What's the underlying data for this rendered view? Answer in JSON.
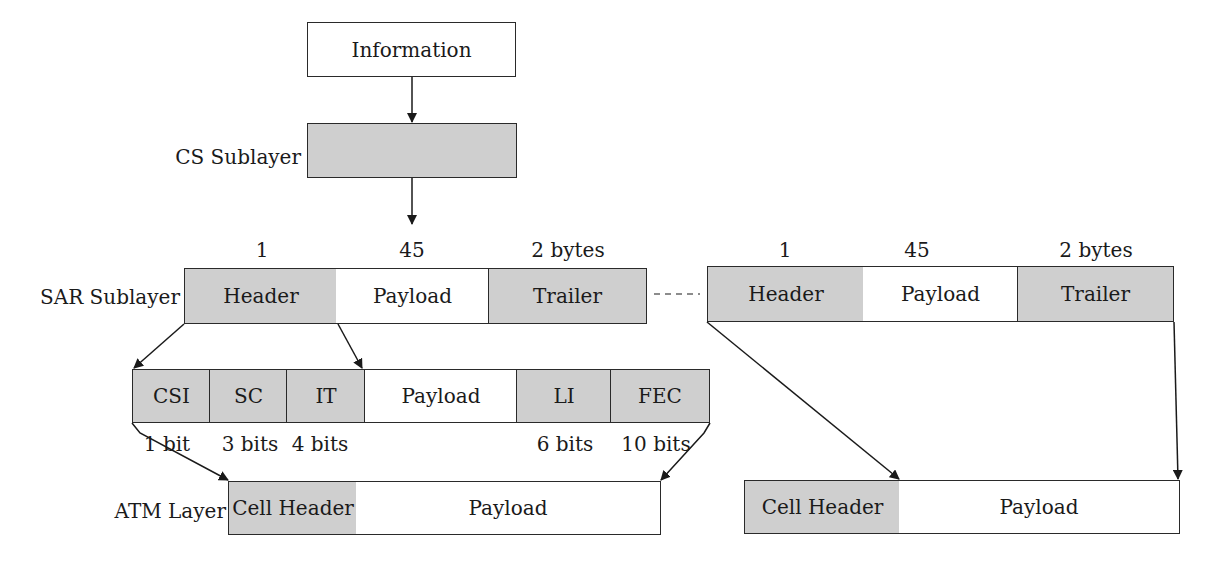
{
  "diagram": {
    "information": {
      "label": "Information"
    },
    "cs_sublayer": {
      "layer_label": "CS Sublayer"
    },
    "sar_left": {
      "layer_label": "SAR Sublayer",
      "sizes": [
        "1",
        "45",
        "2 bytes"
      ],
      "fields": [
        "Header",
        "Payload",
        "Trailer"
      ]
    },
    "sar_right": {
      "sizes": [
        "1",
        "45",
        "2 bytes"
      ],
      "fields": [
        "Header",
        "Payload",
        "Trailer"
      ]
    },
    "header_breakdown": {
      "fields": [
        "CSI",
        "SC",
        "IT",
        "Payload",
        "LI",
        "FEC"
      ],
      "bits": [
        "1 bit",
        "3 bits",
        "4 bits",
        "6 bits",
        "10 bits"
      ]
    },
    "atm_left": {
      "layer_label": "ATM Layer",
      "fields": [
        "Cell Header",
        "Payload"
      ]
    },
    "atm_right": {
      "fields": [
        "Cell Header",
        "Payload"
      ]
    },
    "colors": {
      "shaded": "#cfcfcf",
      "line": "#2a2a2a"
    }
  }
}
